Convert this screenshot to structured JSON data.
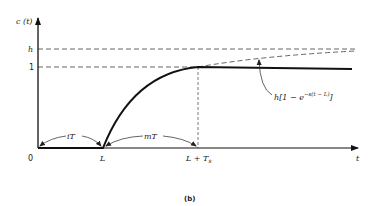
{
  "figure": {
    "caption": "(b)",
    "y_axis_label": "c (t)",
    "x_axis_label": "t",
    "y_ticks": {
      "h": "h",
      "one": "1"
    },
    "x_ticks": {
      "origin": "0",
      "L": "L",
      "L_plus_Ts": "L + T",
      "Ts_subscript": "s"
    },
    "intervals": {
      "iT": "iT",
      "mT": "mT"
    },
    "curve_annotation": {
      "prefix": "h[1 − e",
      "exponent": "−s(t − L)",
      "suffix": "]"
    }
  },
  "colors": {
    "line": "#111111",
    "dashed": "#555555",
    "background": "#ffffff"
  }
}
